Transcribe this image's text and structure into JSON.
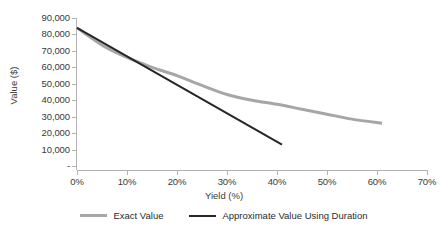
{
  "chart_data": {
    "type": "line",
    "title": "",
    "xlabel": "Yield (%)",
    "ylabel": "Value ($)",
    "xlim": [
      0,
      70
    ],
    "ylim": [
      0,
      90000
    ],
    "grid": false,
    "legend_position": "bottom",
    "x_tick_labels": [
      "0%",
      "10%",
      "20%",
      "30%",
      "40%",
      "50%",
      "60%",
      "70%"
    ],
    "x_tick_values": [
      0,
      10,
      20,
      30,
      40,
      50,
      60,
      70
    ],
    "y_tick_labels": [
      "90,000",
      "80,000",
      "70,000",
      "60,000",
      "50,000",
      "40,000",
      "30,000",
      "20,000",
      "10,000",
      "-"
    ],
    "y_tick_values": [
      90000,
      80000,
      70000,
      60000,
      50000,
      40000,
      30000,
      20000,
      10000,
      0
    ],
    "series": [
      {
        "name": "Exact Value",
        "color": "#a6a6a6",
        "width": 3,
        "x": [
          0,
          5,
          10,
          15,
          20,
          25,
          30,
          35,
          40,
          45,
          50,
          55,
          61
        ],
        "values": [
          84000,
          73500,
          66000,
          60000,
          55000,
          49000,
          43500,
          40000,
          37500,
          34500,
          31500,
          28500,
          26000
        ]
      },
      {
        "name": "Approximate Value Using Duration",
        "color": "#262626",
        "width": 2,
        "x": [
          0,
          41
        ],
        "values": [
          84000,
          13000
        ]
      }
    ]
  },
  "legend": {
    "items": [
      {
        "label": "Exact Value",
        "color": "#a6a6a6"
      },
      {
        "label": "Approximate Value Using Duration",
        "color": "#262626"
      }
    ]
  },
  "axes": {
    "x_title": "Yield (%)",
    "y_title": "Value ($)"
  },
  "colors": {
    "axis": "#b3b3b3",
    "text": "#3a3a3a",
    "background": "#ffffff",
    "series_exact": "#a6a6a6",
    "series_approx": "#262626"
  }
}
